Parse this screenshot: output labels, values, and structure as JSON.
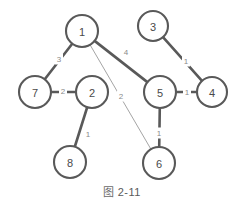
{
  "figure": {
    "caption_glyph": "图",
    "caption_number": "2-11",
    "caption_full": "图 2-11"
  },
  "colors": {
    "node_stroke": "#595959",
    "node_fill": "#ffffff",
    "edge_thick": "#595959",
    "edge_thin": "#9a9a9a",
    "label_text": "#4a4a4a",
    "weight_text": "#8a8a8a",
    "background": "#ffffff"
  },
  "chart_data": {
    "type": "diagram",
    "nodes": [
      {
        "id": "1",
        "label": "1",
        "cx": 82,
        "cy": 31,
        "r": 16
      },
      {
        "id": "2",
        "label": "2",
        "cx": 92,
        "cy": 92,
        "r": 16
      },
      {
        "id": "3",
        "label": "3",
        "cx": 153,
        "cy": 26,
        "r": 15
      },
      {
        "id": "4",
        "label": "4",
        "cx": 212,
        "cy": 92,
        "r": 15
      },
      {
        "id": "5",
        "label": "5",
        "cx": 160,
        "cy": 92,
        "r": 16
      },
      {
        "id": "6",
        "label": "6",
        "cx": 159,
        "cy": 163,
        "r": 16
      },
      {
        "id": "7",
        "label": "7",
        "cx": 35,
        "cy": 92,
        "r": 16
      },
      {
        "id": "8",
        "label": "8",
        "cx": 70,
        "cy": 162,
        "r": 16
      }
    ],
    "edges": [
      {
        "source": "1",
        "target": "7",
        "weight": "3",
        "style": "thick",
        "lx": 59,
        "ly": 59
      },
      {
        "source": "1",
        "target": "5",
        "weight": "4",
        "style": "thick",
        "lx": 126,
        "ly": 52
      },
      {
        "source": "1",
        "target": "6",
        "weight": "2",
        "style": "thin",
        "lx": 121,
        "ly": 96
      },
      {
        "source": "7",
        "target": "2",
        "weight": "2",
        "style": "thick",
        "lx": 63,
        "ly": 91
      },
      {
        "source": "2",
        "target": "8",
        "weight": "1",
        "style": "thick",
        "lx": 88,
        "ly": 134
      },
      {
        "source": "3",
        "target": "4",
        "weight": "1",
        "style": "thick",
        "lx": 186,
        "ly": 61
      },
      {
        "source": "5",
        "target": "4",
        "weight": "1",
        "style": "thick",
        "lx": 187,
        "ly": 92
      },
      {
        "source": "5",
        "target": "6",
        "weight": "1",
        "style": "thick",
        "lx": 159,
        "ly": 133
      }
    ],
    "xlabel": "",
    "ylabel": "",
    "grid": false,
    "legend": null
  }
}
